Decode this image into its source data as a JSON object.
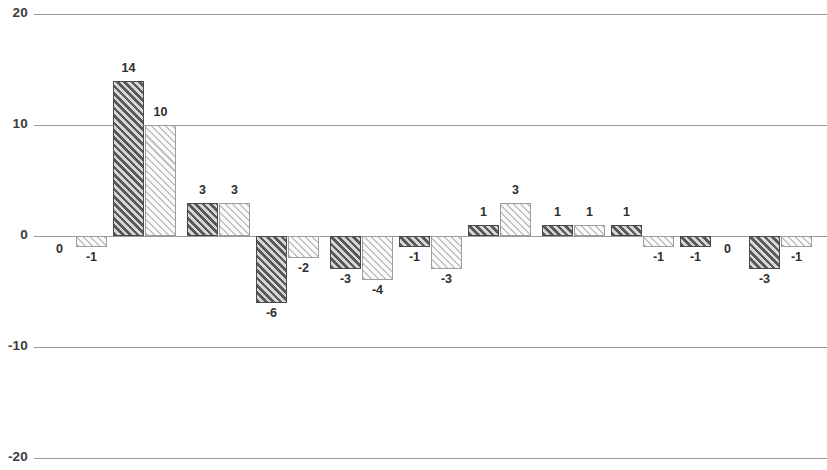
{
  "chart_data": {
    "type": "bar",
    "title": "",
    "subtitle": "",
    "xlabel": "",
    "ylabel": "",
    "ylim": [
      -20,
      20
    ],
    "y_ticks": [
      20,
      10,
      0,
      -10,
      -20
    ],
    "y_tick_labels": [
      "20",
      "10",
      "0",
      "-10",
      "-20"
    ],
    "grid": true,
    "grid_axis": "y",
    "legend": "none",
    "x_axis_visible": false,
    "x_tick_labels": [],
    "categories": [
      "1",
      "2",
      "3",
      "4",
      "5",
      "6",
      "7",
      "8",
      "9",
      "10",
      "11",
      "12"
    ],
    "series": [
      {
        "name": "Series 1",
        "style": "dark-hatched",
        "values": [
          0,
          14,
          3,
          -6,
          -3,
          -1,
          1,
          1,
          1,
          -1,
          0,
          -3
        ]
      },
      {
        "name": "Series 2",
        "style": "light-hatched",
        "values": [
          -1,
          10,
          3,
          -2,
          -4,
          -3,
          3,
          1,
          -1,
          0,
          -1,
          -1
        ]
      }
    ],
    "bars": [
      {
        "label": "0",
        "value": 0,
        "style": "dark",
        "x": 44,
        "width": 31
      },
      {
        "label": "-1",
        "value": -1,
        "style": "light",
        "x": 76,
        "width": 31
      },
      {
        "label": "14",
        "value": 14,
        "style": "dark",
        "x": 113,
        "width": 31
      },
      {
        "label": "10",
        "value": 10,
        "style": "light",
        "x": 145,
        "width": 31
      },
      {
        "label": "3",
        "value": 3,
        "style": "dark",
        "x": 187,
        "width": 31
      },
      {
        "label": "3",
        "value": 3,
        "style": "light",
        "x": 219,
        "width": 31
      },
      {
        "label": "-6",
        "value": -6,
        "style": "dark",
        "x": 256,
        "width": 31
      },
      {
        "label": "-2",
        "value": -2,
        "style": "light",
        "x": 288,
        "width": 31
      },
      {
        "label": "-3",
        "value": -3,
        "style": "dark",
        "x": 330,
        "width": 31
      },
      {
        "label": "-4",
        "value": -4,
        "style": "light",
        "x": 362,
        "width": 31
      },
      {
        "label": "-1",
        "value": -1,
        "style": "dark",
        "x": 399,
        "width": 31
      },
      {
        "label": "-3",
        "value": -3,
        "style": "light",
        "x": 431,
        "width": 31
      },
      {
        "label": "1",
        "value": 1,
        "style": "dark",
        "x": 468,
        "width": 31
      },
      {
        "label": "3",
        "value": 3,
        "style": "light",
        "x": 500,
        "width": 31
      },
      {
        "label": "1",
        "value": 1,
        "style": "dark",
        "x": 542,
        "width": 31
      },
      {
        "label": "1",
        "value": 1,
        "style": "light",
        "x": 574,
        "width": 31
      },
      {
        "label": "1",
        "value": 1,
        "style": "dark",
        "x": 611,
        "width": 31
      },
      {
        "label": "-1",
        "value": -1,
        "style": "light",
        "x": 643,
        "width": 31
      },
      {
        "label": "-1",
        "value": -1,
        "style": "dark",
        "x": 680,
        "width": 31
      },
      {
        "label": "0",
        "value": 0,
        "style": "light",
        "x": 712,
        "width": 31
      },
      {
        "label": "-3",
        "value": -3,
        "style": "dark",
        "x": 749,
        "width": 31
      },
      {
        "label": "-1",
        "value": -1,
        "style": "light",
        "x": 781,
        "width": 31
      }
    ]
  },
  "geometry": {
    "zero_y": 236,
    "unit_px": 11.1,
    "grid_left": 34,
    "grid_width": 793
  },
  "colors": {
    "gridline": "#9a9a9a",
    "dark_bar_hatch": "#5a5a5a",
    "light_bar_hatch": "#c2c2c2",
    "label_text": "#2e2e2e",
    "axis_text": "#3b3b3b",
    "background": "#ffffff"
  }
}
